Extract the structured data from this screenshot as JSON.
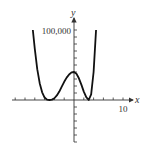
{
  "chart_data": {
    "type": "line",
    "title": "",
    "xlabel": "x",
    "ylabel": "y",
    "x_tick_label": "10",
    "y_tick_label": "100,000",
    "x_tick_step": 2,
    "y_tick_step": 10000,
    "xlim": [
      -15,
      12
    ],
    "ylim": [
      -60000,
      115000
    ],
    "grid": false,
    "legend": null,
    "series": [
      {
        "name": "f(x)",
        "x": [
          -8.4,
          -8.0,
          -7.5,
          -7.0,
          -6.5,
          -6.0,
          -5.5,
          -5.0,
          -4.5,
          -4.0,
          -3.5,
          -3.0,
          -2.5,
          -2.0,
          -1.5,
          -1.0,
          -0.5,
          0.0,
          0.5,
          1.0,
          1.5,
          2.0,
          2.5,
          3.0,
          3.5,
          4.0,
          4.5
        ],
        "y": [
          100000,
          73000,
          44000,
          24000,
          11000,
          3500,
          500,
          0,
          500,
          2500,
          6500,
          12000,
          19000,
          26000,
          32000,
          36500,
          39500,
          40000,
          37500,
          31000,
          22000,
          12000,
          4000,
          0,
          8000,
          40000,
          100000
        ]
      }
    ],
    "color": "#111111"
  }
}
